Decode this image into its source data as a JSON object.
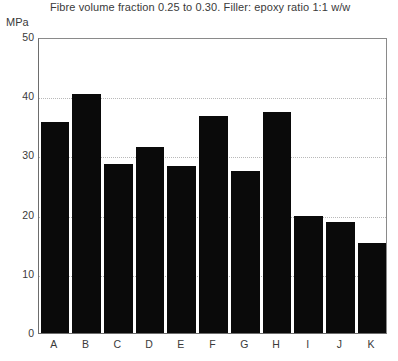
{
  "chart_data": {
    "type": "bar",
    "title": "Fibre volume fraction 0.25 to 0.30. Filler: epoxy ratio 1:1 w/w",
    "xlabel": "",
    "ylabel": "MPa",
    "categories": [
      "A",
      "B",
      "C",
      "D",
      "E",
      "F",
      "G",
      "H",
      "I",
      "J",
      "K"
    ],
    "values": [
      35.6,
      40.4,
      28.6,
      31.5,
      28.2,
      36.6,
      27.4,
      37.4,
      19.8,
      18.7,
      15.2
    ],
    "ylim": [
      0,
      50
    ],
    "yticks": [
      0,
      10,
      20,
      30,
      40,
      50
    ],
    "ytick_labels": [
      "0",
      "10",
      "20",
      "30",
      "40",
      "50"
    ],
    "grid": true,
    "grid_axis": "y",
    "legend": false,
    "bar_color": "#0a0a0a",
    "axis_color": "#6d6d6d",
    "grid_color": "#b9b9b9",
    "text_color": "#3a3a3a"
  }
}
